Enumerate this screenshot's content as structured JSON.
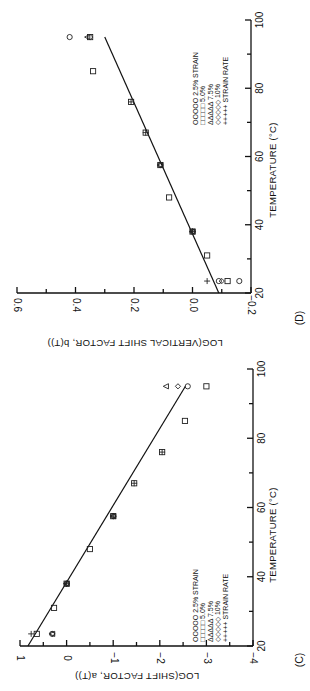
{
  "figure": {
    "orientation": "rotated 90 degrees clockwise",
    "panels": [
      "(C)",
      "(D)"
    ]
  },
  "chart_data": [
    {
      "type": "scatter",
      "panel_label": "(C)",
      "title": "",
      "xlabel": "TEMPERATURE (°C)",
      "ylabel": "LOG(SHIFT FACTOR, a(T))",
      "xlim": [
        20,
        100
      ],
      "ylim": [
        -4,
        1
      ],
      "x_ticks": [
        "20",
        "40",
        "60",
        "80",
        "100"
      ],
      "y_ticks": [
        "1",
        "0",
        "−1",
        "−2",
        "−3",
        "−4"
      ],
      "grid": false,
      "legend": {
        "position": "lower right (rotated)",
        "entries": [
          {
            "marker": "OOOOO",
            "label": "2.5%  STRAIN"
          },
          {
            "marker": "□□□□□",
            "label": "5.0%"
          },
          {
            "marker": "ΔΔΔΔΔ",
            "label": "7.5%"
          },
          {
            "marker": "◇◇◇◇◇",
            "label": "10%"
          },
          {
            "marker": "+++++",
            "label": "STRAIN  RATE"
          }
        ]
      },
      "series": [
        {
          "name": "2.5% strain",
          "marker": "circle",
          "points": [
            [
              23.5,
              0.31
            ],
            [
              38,
              0.0
            ],
            [
              57.5,
              -1.0
            ],
            [
              95,
              -2.6
            ]
          ]
        },
        {
          "name": "5.0% strain",
          "marker": "square",
          "points": [
            [
              23.5,
              0.64
            ],
            [
              31,
              0.27
            ],
            [
              38,
              0.0
            ],
            [
              48,
              -0.5
            ],
            [
              57.5,
              -1.0
            ],
            [
              67,
              -1.45
            ],
            [
              76,
              -2.05
            ],
            [
              85,
              -2.54
            ],
            [
              95,
              -3.0
            ]
          ]
        },
        {
          "name": "7.5% strain",
          "marker": "triangle",
          "points": [
            [
              23.5,
              0.31
            ],
            [
              38,
              0.0
            ],
            [
              57.5,
              -1.0
            ],
            [
              95,
              -2.13
            ]
          ]
        },
        {
          "name": "10% strain",
          "marker": "diamond",
          "points": [
            [
              23.5,
              0.31
            ],
            [
              38,
              0.0
            ],
            [
              57.5,
              -1.0
            ],
            [
              95,
              -2.39
            ]
          ]
        },
        {
          "name": "strain rate",
          "marker": "plus",
          "points": [
            [
              23.5,
              0.76
            ],
            [
              38,
              0.0
            ],
            [
              57.5,
              -1.0
            ],
            [
              67,
              -1.45
            ],
            [
              76,
              -2.05
            ]
          ]
        }
      ],
      "fit_line": {
        "from": [
          20,
          0.83
        ],
        "to": [
          95,
          -2.55
        ]
      }
    },
    {
      "type": "scatter",
      "panel_label": "(D)",
      "title": "",
      "xlabel": "TEMPERATURE (°C)",
      "ylabel": "LOG(VERTICAL SHIFT FACTOR, b(T))",
      "xlim": [
        20,
        100
      ],
      "ylim": [
        -0.2,
        0.6
      ],
      "x_ticks": [
        "20",
        "40",
        "60",
        "80",
        "100"
      ],
      "y_ticks": [
        "0.6",
        "0.4",
        "0.2",
        "0.0",
        "−0.2"
      ],
      "grid": false,
      "legend": {
        "position": "lower right (rotated)",
        "entries": [
          {
            "marker": "OOOOO",
            "label": "2.5%  STRAIN"
          },
          {
            "marker": "□□□□□",
            "label": "5.0%"
          },
          {
            "marker": "ΔΔΔΔΔ",
            "label": "7.5%"
          },
          {
            "marker": "◇◇◇◇◇",
            "label": "10%"
          },
          {
            "marker": "+++++",
            "label": "STRAIN  RATE"
          }
        ]
      },
      "series": [
        {
          "name": "2.5% strain",
          "marker": "circle",
          "points": [
            [
              23.5,
              -0.09
            ],
            [
              23.5,
              -0.16
            ],
            [
              38,
              0.0
            ],
            [
              57.5,
              0.11
            ],
            [
              95,
              0.42
            ]
          ]
        },
        {
          "name": "5.0% strain",
          "marker": "square",
          "points": [
            [
              23.5,
              -0.12
            ],
            [
              31,
              -0.05
            ],
            [
              38,
              0.0
            ],
            [
              48,
              0.08
            ],
            [
              57.5,
              0.11
            ],
            [
              67,
              0.16
            ],
            [
              76,
              0.21
            ],
            [
              85,
              0.34
            ],
            [
              95,
              0.35
            ]
          ]
        },
        {
          "name": "7.5% strain",
          "marker": "triangle",
          "points": [
            [
              38,
              0.0
            ],
            [
              57.5,
              0.11
            ],
            [
              95,
              0.36
            ]
          ]
        },
        {
          "name": "10% strain",
          "marker": "diamond",
          "points": [
            [
              23.5,
              -0.1
            ],
            [
              38,
              0.0
            ],
            [
              57.5,
              0.11
            ],
            [
              95,
              0.35
            ]
          ]
        },
        {
          "name": "strain rate",
          "marker": "plus",
          "points": [
            [
              23.5,
              -0.05
            ],
            [
              38,
              0.0
            ],
            [
              67,
              0.16
            ],
            [
              76,
              0.21
            ]
          ]
        }
      ],
      "fit_line": {
        "from": [
          20,
          -0.09
        ],
        "to": [
          95,
          0.3
        ]
      }
    }
  ]
}
